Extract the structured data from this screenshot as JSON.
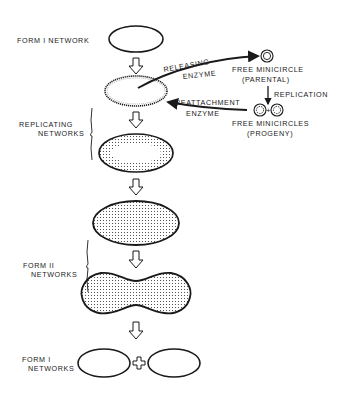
{
  "diagram": {
    "type": "kinetoplast-dna-replication-scheme",
    "stages": [
      {
        "id": "form1-network",
        "label": "FORM I NETWORK"
      },
      {
        "id": "replicating-networks",
        "label_lines": [
          "REPLICATING",
          "NETWORKS"
        ]
      },
      {
        "id": "form2-networks",
        "label_lines": [
          "FORM II",
          "NETWORKS"
        ]
      },
      {
        "id": "form1-networks-progeny",
        "label_lines": [
          "FORM I",
          "NETWORKS"
        ]
      }
    ],
    "enzymes": {
      "releasing": [
        "RELEASING",
        "ENZYME"
      ],
      "reattachment": [
        "REATTACHMENT",
        "ENZYME"
      ]
    },
    "minicircles": {
      "parental": [
        "FREE MINICIRCLE",
        "(PARENTAL)"
      ],
      "progeny": [
        "FREE MINICIRCLES",
        "(PROGENY)"
      ],
      "process": "REPLICATION"
    },
    "colors": {
      "ink": "#1a1a1a",
      "background": "#ffffff"
    }
  }
}
